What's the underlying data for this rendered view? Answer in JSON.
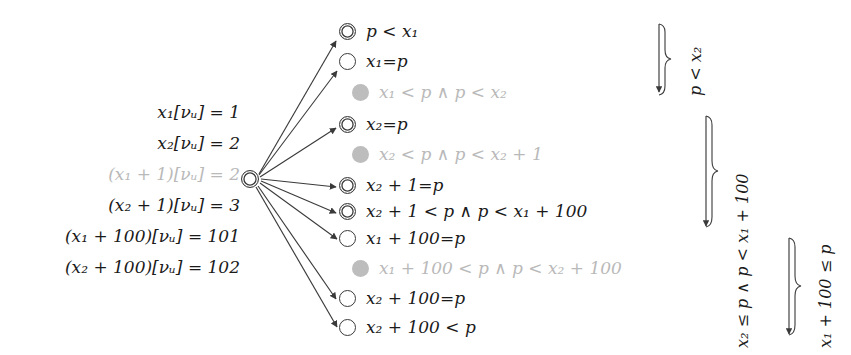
{
  "figure": {
    "kind": "valuation-and-region-graph",
    "background_color": "#ffffff",
    "ink_color": "#1a1a1a",
    "dim_color": "#b9b9b9",
    "ghost_node_color": "#bdbdbd"
  },
  "valuations": {
    "caption": "",
    "rows": [
      {
        "id": "v1",
        "text": "x₁[νᵤ] = 1",
        "dim": false
      },
      {
        "id": "v2",
        "text": "x₂[νᵤ] = 2",
        "dim": false
      },
      {
        "id": "v3",
        "text": "(x₁ + 1)[νᵤ] = 2",
        "dim": true
      },
      {
        "id": "v4",
        "text": "(x₂ + 1)[νᵤ] = 3",
        "dim": false
      },
      {
        "id": "v5",
        "text": "(x₁ + 100)[νᵤ] = 101",
        "dim": false
      },
      {
        "id": "v6",
        "text": "(x₂ + 100)[νᵤ] = 102",
        "dim": false
      }
    ]
  },
  "source_node": {
    "name": "source-state",
    "style": "double",
    "label": ""
  },
  "regions": [
    {
      "id": "r1",
      "label": "p < x₁",
      "node_style": "double-outer-single",
      "shape": "single",
      "dim": false,
      "has_edge": true,
      "y": 31
    },
    {
      "id": "r2",
      "label": "x₁=p",
      "shape": "single",
      "dim": false,
      "has_edge": true,
      "y": 61
    },
    {
      "id": "r3",
      "label": "x₁ < p  ∧  p < x₂",
      "shape": "ghost",
      "dim": true,
      "has_edge": false,
      "y": 92
    },
    {
      "id": "r4",
      "label": "x₂=p",
      "shape": "double",
      "dim": false,
      "has_edge": true,
      "y": 124
    },
    {
      "id": "r5",
      "label": "x₂ < p  ∧  p < x₂ + 1",
      "shape": "ghost",
      "dim": true,
      "has_edge": false,
      "y": 154
    },
    {
      "id": "r6",
      "label": "x₂ + 1=p",
      "shape": "double",
      "dim": false,
      "has_edge": true,
      "y": 185
    },
    {
      "id": "r7",
      "label": "x₂ + 1 < p  ∧  p < x₁ + 100",
      "shape": "double",
      "dim": false,
      "has_edge": true,
      "y": 211
    },
    {
      "id": "r8",
      "label": "x₁ + 100=p",
      "shape": "single",
      "dim": false,
      "has_edge": true,
      "y": 238
    },
    {
      "id": "r9",
      "label": "x₁ + 100 < p  ∧  p < x₂ + 100",
      "shape": "ghost",
      "dim": true,
      "has_edge": false,
      "y": 268
    },
    {
      "id": "r10",
      "label": "x₂ + 100=p",
      "shape": "single",
      "dim": false,
      "has_edge": true,
      "y": 298
    },
    {
      "id": "r11",
      "label": "x₂ + 100 < p",
      "shape": "single",
      "dim": false,
      "has_edge": true,
      "y": 327
    }
  ],
  "group_braces": [
    {
      "id": "b1",
      "label": "p < x₂",
      "x": 664,
      "top": 22,
      "height": 70
    },
    {
      "id": "b2",
      "label": "x₂ ≤ p ∧ p < x₁ + 100",
      "x": 710,
      "top": 113,
      "height": 113
    },
    {
      "id": "b3",
      "label": "x₁ + 100 ≤ p",
      "x": 793,
      "top": 236,
      "height": 97
    }
  ]
}
